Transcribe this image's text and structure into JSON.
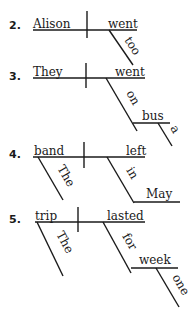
{
  "diagrams": [
    {
      "number": "2.",
      "subject": "Alison",
      "verb": "went",
      "modifiers": [
        {
          "word": "too",
          "attached_to": "went",
          "role": "adverb"
        }
      ]
    },
    {
      "number": "3.",
      "subject": "They",
      "verb": "went",
      "modifiers": [
        {
          "word": "on",
          "attached_to": "went",
          "role": "preposition"
        },
        {
          "word": "bus",
          "attached_to": "on",
          "role": "object-of-preposition"
        },
        {
          "word": "a",
          "attached_to": "bus",
          "role": "article"
        }
      ]
    },
    {
      "number": "4.",
      "subject": "band",
      "verb": "left",
      "modifiers": [
        {
          "word": "The",
          "attached_to": "band",
          "role": "article"
        },
        {
          "word": "in",
          "attached_to": "left",
          "role": "preposition"
        },
        {
          "word": "May",
          "attached_to": "in",
          "role": "object-of-preposition"
        }
      ]
    },
    {
      "number": "5.",
      "subject": "trip",
      "verb": "lasted",
      "modifiers": [
        {
          "word": "The",
          "attached_to": "trip",
          "role": "article"
        },
        {
          "word": "for",
          "attached_to": "lasted",
          "role": "preposition"
        },
        {
          "word": "week",
          "attached_to": "for",
          "role": "object-of-preposition"
        },
        {
          "word": "one",
          "attached_to": "week",
          "role": "adjective"
        }
      ]
    }
  ]
}
